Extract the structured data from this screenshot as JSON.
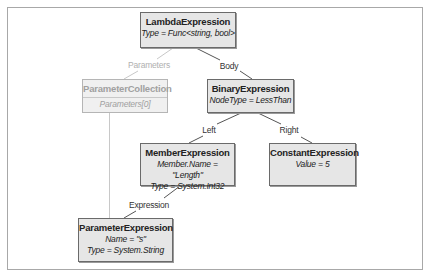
{
  "diagram": {
    "nodes": {
      "lambda": {
        "title": "LambdaExpression",
        "props": [
          "Type = Func<string, bool>"
        ]
      },
      "paramCollection": {
        "title": "ParameterCollection",
        "props": [
          "Parameters[0]"
        ]
      },
      "binary": {
        "title": "BinaryExpression",
        "props": [
          "NodeType = LessThan"
        ]
      },
      "member": {
        "title": "MemberExpression",
        "props": [
          "Member.Name = \"Length\"",
          "Type = System.Int32"
        ]
      },
      "constant": {
        "title": "ConstantExpression",
        "props": [
          "Value = 5"
        ]
      },
      "parameter": {
        "title": "ParameterExpression",
        "props": [
          "Name = \"s\"",
          "Type = System.String"
        ]
      }
    },
    "edges": {
      "parameters": "Parameters",
      "body": "Body",
      "left": "Left",
      "right": "Right",
      "expression": "Expression"
    },
    "colors": {
      "node_fill": "#e6e6e6",
      "node_border": "#6a6a6a",
      "faded_text": "#a0a0a0",
      "line": "#555555",
      "faded_line": "#c0c0c0"
    }
  }
}
